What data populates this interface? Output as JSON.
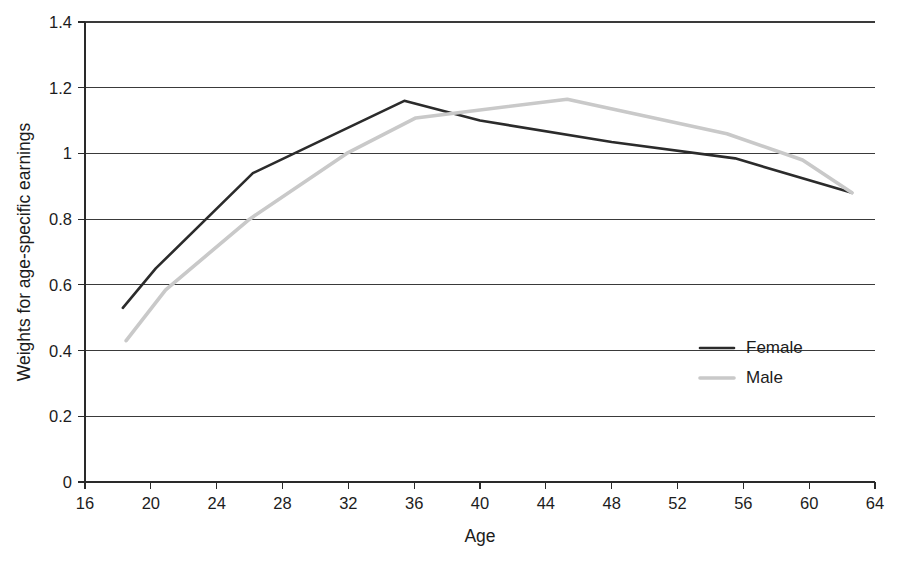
{
  "chart_data": {
    "type": "line",
    "title": "",
    "xlabel": "Age",
    "ylabel": "Weights for age-specific earnings",
    "xlim": [
      16,
      64
    ],
    "ylim": [
      0,
      1.4
    ],
    "grid": true,
    "legend_position": "center-right",
    "x_ticks": [
      "16",
      "20",
      "24",
      "28",
      "32",
      "36",
      "40",
      "44",
      "48",
      "52",
      "56",
      "60",
      "64"
    ],
    "y_ticks": [
      "0",
      "0.2",
      "0.4",
      "0.6",
      "0.8",
      "1",
      "1.2",
      "1.4"
    ],
    "series": [
      {
        "name": "Female",
        "color": "#2b2b2b",
        "points": [
          [
            18.3,
            0.53
          ],
          [
            20.3,
            0.65
          ],
          [
            26.2,
            0.94
          ],
          [
            35.4,
            1.16
          ],
          [
            40.0,
            1.1
          ],
          [
            48.0,
            1.035
          ],
          [
            55.5,
            0.985
          ],
          [
            62.6,
            0.88
          ]
        ]
      },
      {
        "name": "Male",
        "color": "#c9c9c9",
        "points": [
          [
            18.5,
            0.43
          ],
          [
            20.9,
            0.585
          ],
          [
            26.0,
            0.8
          ],
          [
            31.9,
            1.0
          ],
          [
            36.1,
            1.108
          ],
          [
            45.3,
            1.165
          ],
          [
            55.0,
            1.06
          ],
          [
            59.6,
            0.98
          ],
          [
            62.6,
            0.88
          ]
        ]
      }
    ]
  },
  "legend": {
    "entries": [
      {
        "label": "Female",
        "color": "#2b2b2b"
      },
      {
        "label": "Male",
        "color": "#c9c9c9"
      }
    ]
  },
  "axes": {
    "x_title": "Age",
    "y_title": "Weights for age-specific earnings"
  }
}
